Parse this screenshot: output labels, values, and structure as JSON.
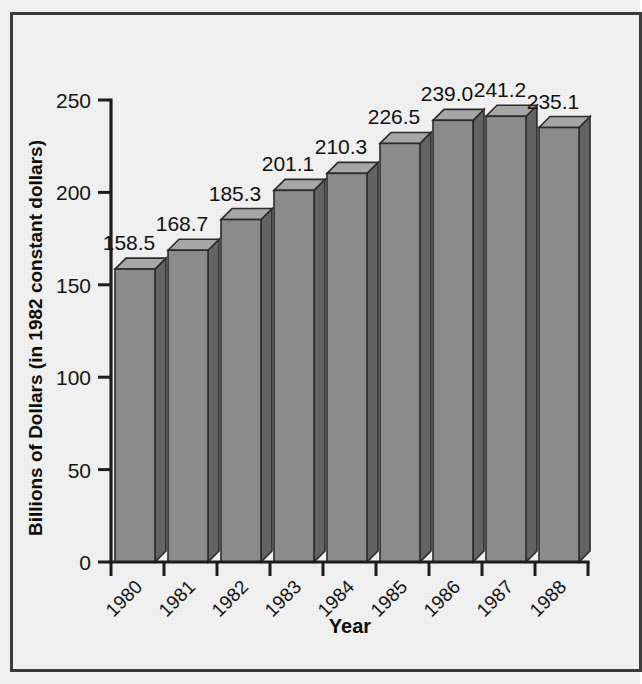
{
  "chart_data": {
    "type": "bar",
    "title": "",
    "subtitle": "",
    "xlabel": "Year",
    "ylabel": "Billions of Dollars (in 1982 constant dollars)",
    "categories": [
      "1980",
      "1981",
      "1982",
      "1983",
      "1984",
      "1985",
      "1986",
      "1987",
      "1988"
    ],
    "values": [
      158.5,
      168.7,
      185.3,
      201.1,
      210.3,
      226.5,
      239.0,
      241.2,
      235.1
    ],
    "value_labels": [
      "158.5",
      "168.7",
      "185.3",
      "201.1",
      "210.3",
      "226.5",
      "239.0",
      "241.2",
      "235.1"
    ],
    "ylim": [
      0,
      250
    ],
    "yticks": [
      0,
      50,
      100,
      150,
      200,
      250
    ],
    "ytick_labels": [
      "0",
      "50",
      "100",
      "150",
      "200",
      "250"
    ],
    "grid": false,
    "legend": null,
    "legend_position": "none",
    "series": [
      {
        "name": "Billions of Dollars (in 1982 constant dollars)",
        "values": [
          158.5,
          168.7,
          185.3,
          201.1,
          210.3,
          226.5,
          239.0,
          241.2,
          235.1
        ]
      }
    ],
    "style": "3d-bar",
    "xtick_label_rotation": -45
  },
  "colors": {
    "background": "#f1f1f1",
    "frame": "#3b3b3b",
    "axis": "#1d1d1d",
    "bar_front": "#8b8b8b",
    "bar_top": "#a6a6a6",
    "bar_side": "#636363",
    "text": "#111111"
  }
}
